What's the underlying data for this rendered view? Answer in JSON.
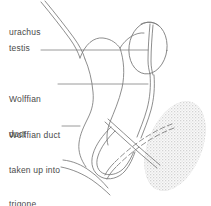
{
  "figure": {
    "style": "hand-drawn anatomical line diagram, pencil line art on white",
    "line_color": "#7a7a7a",
    "label_color": "#4a4a4a",
    "shading_color": "#d9d9d9",
    "background": "#ffffff"
  },
  "labels": [
    {
      "id": "urachus",
      "name": "urachus",
      "text": "urachus",
      "lines": [
        "urachus"
      ],
      "has_leader": false
    },
    {
      "id": "testis",
      "name": "testis",
      "text": "testis",
      "lines": [
        "testis"
      ],
      "has_leader": true
    },
    {
      "id": "wolffian-duct",
      "name": "Wolffian duct",
      "text": "Wolffian duct",
      "lines": [
        "Wolffian",
        "duct"
      ],
      "has_leader": true
    },
    {
      "id": "wolffian-duct-trigone",
      "name": "Wolffian duct taken up into trigone",
      "text": "Wolffian duct taken up into trigone",
      "lines": [
        "Wolffian duct",
        "taken up into",
        "trigone"
      ],
      "has_leader": true
    }
  ],
  "structures": [
    {
      "id": "urachus-tube",
      "name": "urachus",
      "shape": "narrow double-line tube descending from top-left"
    },
    {
      "id": "bladder-body",
      "name": "bladder outline",
      "shape": "large curved body in centre"
    },
    {
      "id": "testis-oval",
      "name": "testis",
      "shape": "vertical oval at upper right with internal duct line"
    },
    {
      "id": "wolffian-duct-line",
      "name": "Wolffian duct",
      "shape": "long double line running down from testis"
    },
    {
      "id": "duct-crossing",
      "name": "duct crossing",
      "shape": "X crossing of ducts at lower centre"
    },
    {
      "id": "duct-loop",
      "name": "duct loop",
      "shape": "hairpin loop at lower left of crossing"
    },
    {
      "id": "trigone-shading",
      "name": "trigone",
      "shape": "stippled diagonal oval at lower right"
    }
  ]
}
